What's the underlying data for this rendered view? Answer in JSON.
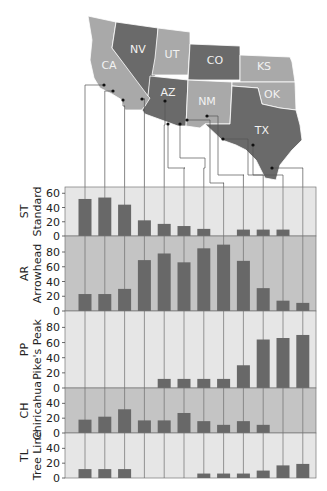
{
  "chart_data": {
    "type": "bar",
    "title": "",
    "layout": "small multiples: map of southwestern US states with leader lines to 12 sample sites, 5 stacked bar panels",
    "map": {
      "states": [
        {
          "abbr": "CA",
          "shade": "light"
        },
        {
          "abbr": "NV",
          "shade": "dark"
        },
        {
          "abbr": "UT",
          "shade": "light"
        },
        {
          "abbr": "CO",
          "shade": "dark"
        },
        {
          "abbr": "KS",
          "shade": "light"
        },
        {
          "abbr": "AZ",
          "shade": "dark"
        },
        {
          "abbr": "NM",
          "shade": "light"
        },
        {
          "abbr": "OK",
          "shade": "light"
        },
        {
          "abbr": "TX",
          "shade": "dark"
        }
      ],
      "site_count": 12
    },
    "categories": [
      "1",
      "2",
      "3",
      "4",
      "5",
      "6",
      "7",
      "8",
      "9",
      "10",
      "11",
      "12"
    ],
    "panels": [
      {
        "code": "ST",
        "name": "Standard",
        "ticks": [
          0,
          20,
          40,
          60
        ],
        "ylim": [
          0,
          66
        ],
        "values": [
          52,
          54,
          44,
          22,
          17,
          14,
          10,
          0,
          9,
          9,
          9,
          0
        ]
      },
      {
        "code": "AR",
        "name": "Arrowhead",
        "ticks": [
          0,
          20,
          40,
          60,
          80
        ],
        "ylim": [
          0,
          99
        ],
        "values": [
          23,
          23,
          30,
          69,
          78,
          66,
          85,
          90,
          68,
          31,
          14,
          11
        ]
      },
      {
        "code": "PP",
        "name": "Pike's Peak",
        "ticks": [
          0,
          20,
          40,
          60,
          80
        ],
        "ylim": [
          0,
          99
        ],
        "values": [
          0,
          0,
          0,
          0,
          12,
          12,
          12,
          12,
          30,
          64,
          66,
          70
        ]
      },
      {
        "code": "CH",
        "name": "Chiricahua",
        "ticks": [
          0,
          20,
          40
        ],
        "ylim": [
          0,
          58
        ],
        "values": [
          18,
          22,
          32,
          17,
          17,
          27,
          16,
          11,
          16,
          11,
          0,
          0
        ]
      },
      {
        "code": "TL",
        "name": "Tree Line",
        "ticks": [
          0,
          20,
          40
        ],
        "ylim": [
          0,
          58
        ],
        "values": [
          12,
          12,
          12,
          0,
          0,
          0,
          6,
          6,
          6,
          10,
          17,
          19
        ]
      }
    ],
    "xlabel": "",
    "ylabel": "",
    "grid": "vertical lines at each site",
    "legend": "none"
  },
  "colors": {
    "bar": "#686868",
    "panel_light": "#e6e6e6",
    "panel_dark": "#c4c4c4",
    "state_light": "#a9a9a9",
    "state_dark": "#6a6a6a",
    "line": "#555555"
  }
}
